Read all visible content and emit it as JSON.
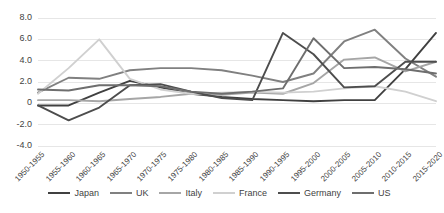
{
  "chart_data": {
    "type": "line",
    "title": "",
    "xlabel": "",
    "ylabel": "",
    "ylim": [
      -4.0,
      8.0
    ],
    "yticks": [
      8.0,
      6.0,
      4.0,
      2.0,
      0,
      -2.0,
      -4.0
    ],
    "ytick_labels": [
      "8.0",
      "6.0",
      "4.0",
      "2.0",
      "0",
      "-2.0",
      "-4.0"
    ],
    "grid": true,
    "legend_position": "bottom",
    "categories": [
      "1950-1955",
      "1955-1960",
      "1960-1965",
      "1965-1970",
      "1970-1975",
      "1975-1980",
      "1980-1985",
      "1985-1990",
      "1990-1995",
      "1995-2000",
      "2000-2005",
      "2005-2010",
      "2010-2015",
      "2015-2020"
    ],
    "series": [
      {
        "name": "Japan",
        "color": "#404040",
        "values": [
          -0.2,
          -0.2,
          1.0,
          2.1,
          1.5,
          0.9,
          0.6,
          0.4,
          0.3,
          0.2,
          0.3,
          0.3,
          3.2,
          6.6
        ]
      },
      {
        "name": "UK",
        "color": "#808080",
        "values": [
          1.0,
          2.4,
          2.3,
          3.1,
          3.3,
          3.3,
          3.1,
          2.6,
          2.0,
          2.8,
          5.8,
          6.9,
          4.2,
          2.5
        ]
      },
      {
        "name": "Italy",
        "color": "#a6a6a6",
        "values": [
          0.3,
          0.3,
          0.2,
          0.4,
          0.6,
          0.9,
          0.8,
          1.0,
          0.9,
          1.9,
          4.1,
          4.3,
          3.0,
          3.9
        ]
      },
      {
        "name": "France",
        "color": "#d0d0d0",
        "values": [
          0.9,
          3.3,
          6.0,
          2.3,
          1.3,
          0.9,
          1.0,
          1.1,
          1.0,
          1.1,
          1.4,
          1.6,
          1.1,
          0.2
        ]
      },
      {
        "name": "Germany",
        "color": "#4d4d4d",
        "values": [
          -0.2,
          -1.6,
          -0.4,
          1.7,
          1.8,
          1.1,
          0.5,
          0.3,
          6.6,
          4.6,
          1.5,
          1.6,
          3.9,
          3.9
        ]
      },
      {
        "name": "US",
        "color": "#6e6e6e",
        "values": [
          1.3,
          1.2,
          1.7,
          1.7,
          1.6,
          1.1,
          0.9,
          1.1,
          1.4,
          6.1,
          3.3,
          3.4,
          3.2,
          2.8
        ]
      }
    ]
  }
}
